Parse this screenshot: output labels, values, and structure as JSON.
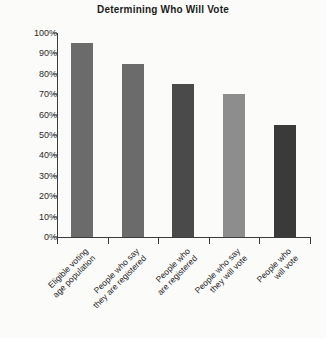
{
  "chart_data": {
    "type": "bar",
    "title": "Determining Who Will Vote",
    "xlabel": "",
    "ylabel": "",
    "ylim": [
      0,
      100
    ],
    "ytick_labels": [
      "100%",
      "90%",
      "80%",
      "70%",
      "60%",
      "50%",
      "40%",
      "30%",
      "20%",
      "10%",
      "0%"
    ],
    "ytick_values": [
      100,
      90,
      80,
      70,
      60,
      50,
      40,
      30,
      20,
      10,
      0
    ],
    "grid": false,
    "legend": "none",
    "categories": [
      "Eligible voting age population",
      "People who say they are registered",
      "People who are registered",
      "People who say they will vote",
      "People who will vote"
    ],
    "category_lines": [
      [
        "Eligible voting",
        "age population"
      ],
      [
        "People who say",
        "they are registered"
      ],
      [
        "People who",
        "are registered"
      ],
      [
        "People who say",
        "they will vote"
      ],
      [
        "People who",
        "will vote"
      ]
    ],
    "values": [
      95,
      85,
      75,
      70,
      55
    ],
    "bar_colors": [
      "#6b6b6b",
      "#6b6b6b",
      "#4a4a4a",
      "#8d8d8d",
      "#3a3a3a"
    ]
  }
}
